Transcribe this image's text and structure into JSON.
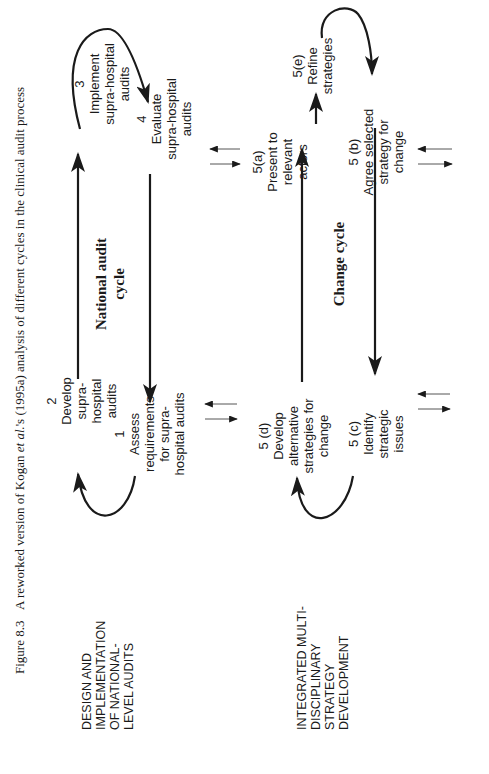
{
  "caption": {
    "figure_label": "Figure 8.3",
    "text_before": "A reworked version of Kogan ",
    "italic": "et al.",
    "text_after": "'s (1995a) analysis of different cycles in the clinical audit process"
  },
  "side_labels": {
    "national": "DESIGN AND\nIMPLEMENTATION\nOF NATIONAL-\nLEVEL AUDITS",
    "change": "INTEGRATED MULTI-\nDISCIPLINARY\nSTRATEGY\nDEVELOPMENT"
  },
  "cycles": {
    "national": {
      "title": "National audit\ncycle",
      "nodes": {
        "n1": "1\nAssess\nrequirements\nfor supra-\nhospital audits",
        "n2": "2\nDevelop\nsupra-\nhospital\naudits",
        "n3": "3\nImplement\nsupra-hospital\naudits",
        "n4": "4\nEvaluate\nsupra-hospital\naudits"
      }
    },
    "change": {
      "title": "Change cycle",
      "nodes": {
        "n5a": "5(a)\nPresent to\nrelevant\nactors",
        "n5b": "5 (b)\nAgree selected\nstrategy for\nchange",
        "n5c": "5 (c)\nIdentify\nstrategic\nissues",
        "n5d": "5 (d)\nDevelop\nalternative\nstrategies for\nchange",
        "n5e": "5(e)\nRefine\nstrategies"
      }
    }
  },
  "colors": {
    "ink": "#1a1a1a",
    "thin_arrow": "#555555",
    "background": "#ffffff"
  }
}
